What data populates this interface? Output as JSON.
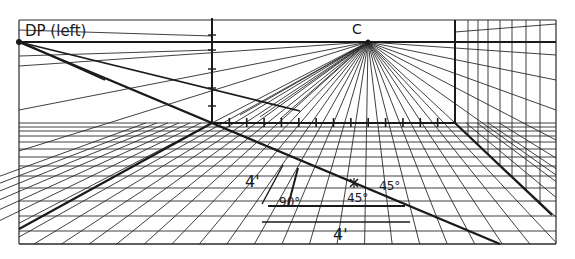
{
  "diagram": {
    "labels": {
      "dp": "DP (left)",
      "vp": "C",
      "vertical_dim": "4'",
      "horizontal_dim": "4'",
      "right_angle": "90°",
      "angle_a": "45°",
      "angle_b": "45°"
    },
    "colors": {
      "ink": "#1a1a1a",
      "paper": "#ffffff",
      "thin": "#2a2a2a"
    },
    "geometry": {
      "frame": {
        "left": 19,
        "top": 20,
        "right": 556,
        "bottom": 244
      },
      "horizon_y": 42,
      "vanishing_point": {
        "x": 368,
        "y": 42
      },
      "dp_point": {
        "x": 19,
        "y": 42
      },
      "back_wall": {
        "left": 212,
        "right": 455,
        "top": 20,
        "bottom": 123
      },
      "right_wall_x": 520
    }
  }
}
